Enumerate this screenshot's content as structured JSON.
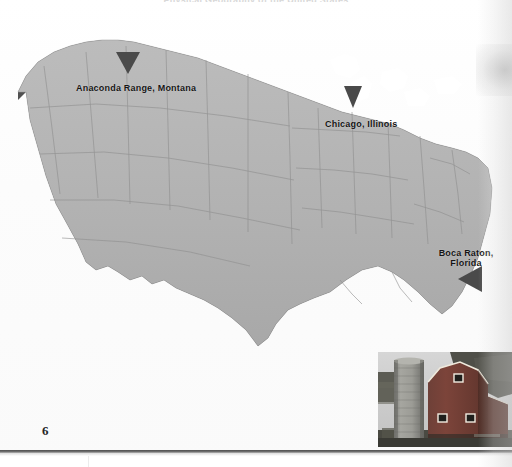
{
  "page": {
    "number": "6",
    "running_head": "Physical Geography of the United States",
    "background_color": "#ffffff"
  },
  "map": {
    "name": "contiguous-united-states-relief-map",
    "type": "3d-extruded-choropleth",
    "surface_color": "#b0b0b0",
    "surface_color_light": "#bcbcbc",
    "extrusion_color": "#4a4a4a",
    "extrusion_color_dark": "#3a3a3a",
    "border_color": "#8c8c8c",
    "lake_color": "#ffffff",
    "markers": [
      {
        "id": "anaconda-range-montana",
        "label": "Anaconda Range, Montana",
        "label_lines": [
          "Anaconda Range, Montana"
        ],
        "marker_shape": "triangle-down",
        "marker_color": "#4a4a4a",
        "label_x": 76,
        "label_y": 83,
        "marker_x": 126,
        "marker_y": 52
      },
      {
        "id": "chicago-illinois",
        "label": "Chicago, Illinois",
        "label_lines": [
          "Chicago, Illinois"
        ],
        "marker_shape": "triangle-down",
        "marker_color": "#4a4a4a",
        "label_x": 325,
        "label_y": 119,
        "marker_x": 352,
        "marker_y": 94
      },
      {
        "id": "boca-raton-florida",
        "label": "Boca Raton, Florida",
        "label_lines": [
          "Boca Raton,",
          "Florida"
        ],
        "marker_shape": "triangle-left",
        "marker_color": "#4a4a4a",
        "label_x": 432,
        "label_y": 248,
        "marker_x": 468,
        "marker_y": 277
      }
    ]
  },
  "photo": {
    "name": "red-barn-with-silo",
    "caption": "",
    "barn_color": "#8a2f24",
    "silo_color": "#9a9a96",
    "sky_color": "#cfcfcf",
    "ground_color": "#5a5a52",
    "trim_color": "#f0ece2"
  }
}
